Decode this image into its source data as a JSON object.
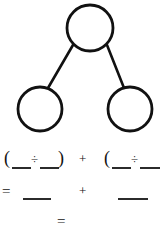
{
  "worksheet": {
    "title": "Number bond division worksheet",
    "ink_color": "#111111",
    "background_color": "#ffffff",
    "width": 160,
    "height": 232
  },
  "diagram": {
    "type": "number-bond",
    "stroke_color": "#111111",
    "stroke_width": 2.6,
    "fill_color": "#ffffff",
    "nodes": [
      {
        "name": "total-circle",
        "label": "",
        "cx": 90,
        "cy": 28,
        "r": 23
      },
      {
        "name": "left-part-circle",
        "label": "",
        "cx": 40,
        "cy": 109,
        "r": 22
      },
      {
        "name": "right-part-circle",
        "label": "",
        "cx": 130,
        "cy": 109,
        "r": 22
      }
    ],
    "edges": [
      {
        "name": "edge-total-to-left",
        "x1": 73,
        "y1": 45,
        "x2": 48,
        "y2": 88
      },
      {
        "name": "edge-total-to-right",
        "x1": 107,
        "y1": 45,
        "x2": 124,
        "y2": 88
      }
    ]
  },
  "equations": {
    "factor_pairs_row": {
      "open_paren_left": "(",
      "divide_left": "÷",
      "close_paren_left": ")",
      "plus": "+",
      "open_paren_right": "(",
      "divide_right": "÷"
    },
    "partial_quotients_row": {
      "equals": "=",
      "plus": "+"
    },
    "final_row": {
      "equals": "="
    }
  }
}
